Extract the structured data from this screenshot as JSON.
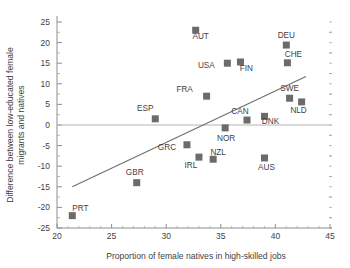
{
  "chart_data": {
    "type": "scatter",
    "title": "",
    "xlabel": "Proportion of female natives in high-skilled jobs",
    "ylabel": "Difference between low-educated female migrants and natives",
    "xlim": [
      20,
      45
    ],
    "ylim": [
      -25,
      25
    ],
    "x_ticks": [
      20,
      25,
      30,
      35,
      40,
      45
    ],
    "x_tick_labels": [
      "20",
      "25",
      "30",
      "35",
      "40",
      "45"
    ],
    "y_ticks": [
      25,
      20,
      15,
      10,
      5,
      0,
      -5,
      -10,
      -15,
      -20,
      -25
    ],
    "y_tick_labels": [
      "25",
      "20",
      "15",
      "10",
      "5",
      "0",
      "-5",
      "-10",
      "-15",
      "-20",
      "-25"
    ],
    "x_minor_step": 1,
    "y_minor_step": 2.5,
    "grid": false,
    "legend": "none",
    "zero_reference_line": 0,
    "marker_shape": "square",
    "marker_color": "#6b6b6b",
    "trend_line": {
      "type": "linear-fit",
      "x_start": 21.4,
      "y_start": -15.0,
      "x_end": 42.8,
      "y_end": 11.8,
      "color": "#6e6e6e"
    },
    "points": [
      {
        "label": "PRT",
        "x": 21.4,
        "y": -22.0,
        "label_dx": 8,
        "label_dy": -5
      },
      {
        "label": "GBR",
        "x": 27.3,
        "y": -14.0,
        "label_dx": -2,
        "label_dy": -8
      },
      {
        "label": "ESP",
        "x": 29.0,
        "y": 1.5,
        "label_dx": -10,
        "label_dy": -8
      },
      {
        "label": "GRC",
        "x": 31.9,
        "y": -4.8,
        "label_dx": -20,
        "label_dy": 5
      },
      {
        "label": "IRL",
        "x": 33.0,
        "y": -7.8,
        "label_dx": -8,
        "label_dy": 11
      },
      {
        "label": "AUT",
        "x": 32.7,
        "y": 23.0,
        "label_dx": 5,
        "label_dy": 9
      },
      {
        "label": "FRA",
        "x": 33.7,
        "y": 7.0,
        "label_dx": -22,
        "label_dy": -4
      },
      {
        "label": "NZL",
        "x": 34.3,
        "y": -8.3,
        "label_dx": 5,
        "label_dy": -4
      },
      {
        "label": "NOR",
        "x": 35.4,
        "y": -0.7,
        "label_dx": 1,
        "label_dy": 13
      },
      {
        "label": "USA",
        "x": 35.6,
        "y": 15.0,
        "label_dx": -21,
        "label_dy": 5
      },
      {
        "label": "FIN",
        "x": 36.8,
        "y": 15.3,
        "label_dx": 6,
        "label_dy": 9
      },
      {
        "label": "CAN",
        "x": 37.4,
        "y": 1.2,
        "label_dx": -7,
        "label_dy": -6
      },
      {
        "label": "DNK",
        "x": 39.0,
        "y": 2.1,
        "label_dx": 6,
        "label_dy": 8
      },
      {
        "label": "AUS",
        "x": 39.0,
        "y": -8.0,
        "label_dx": 2,
        "label_dy": 12
      },
      {
        "label": "DEU",
        "x": 41.0,
        "y": 19.4,
        "label_dx": 0,
        "label_dy": -7
      },
      {
        "label": "CHE",
        "x": 41.1,
        "y": 15.1,
        "label_dx": 6,
        "label_dy": -6
      },
      {
        "label": "SWE",
        "x": 41.3,
        "y": 6.5,
        "label_dx": 0,
        "label_dy": -7
      },
      {
        "label": "NLD",
        "x": 42.4,
        "y": 5.6,
        "label_dx": -3,
        "label_dy": 11
      }
    ]
  }
}
